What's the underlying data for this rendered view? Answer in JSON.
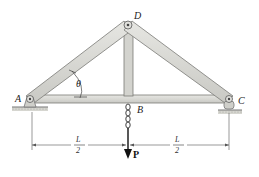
{
  "diagram": {
    "type": "truss",
    "colors": {
      "member_fill": "#d9d9d4",
      "member_edge": "#7a7a76",
      "line": "#333333",
      "ground": "#b8b8b0"
    },
    "joints": {
      "A": {
        "label": "A"
      },
      "B": {
        "label": "B"
      },
      "C": {
        "label": "C"
      },
      "D": {
        "label": "D"
      }
    },
    "members": [
      {
        "name": "AD",
        "from": "A",
        "to": "D"
      },
      {
        "name": "DC",
        "from": "D",
        "to": "C"
      },
      {
        "name": "DB",
        "from": "D",
        "to": "B"
      },
      {
        "name": "AC",
        "from": "A",
        "to": "C"
      }
    ],
    "angle_label": "θ",
    "load": {
      "label": "P",
      "direction": "down",
      "applied_at": "B"
    },
    "dimensions": [
      {
        "numerator": "L",
        "denominator": "2",
        "from": "A",
        "to": "B"
      },
      {
        "numerator": "L",
        "denominator": "2",
        "from": "B",
        "to": "C"
      }
    ],
    "supports": [
      {
        "joint": "A",
        "type": "pin"
      },
      {
        "joint": "C",
        "type": "rocker"
      }
    ]
  }
}
